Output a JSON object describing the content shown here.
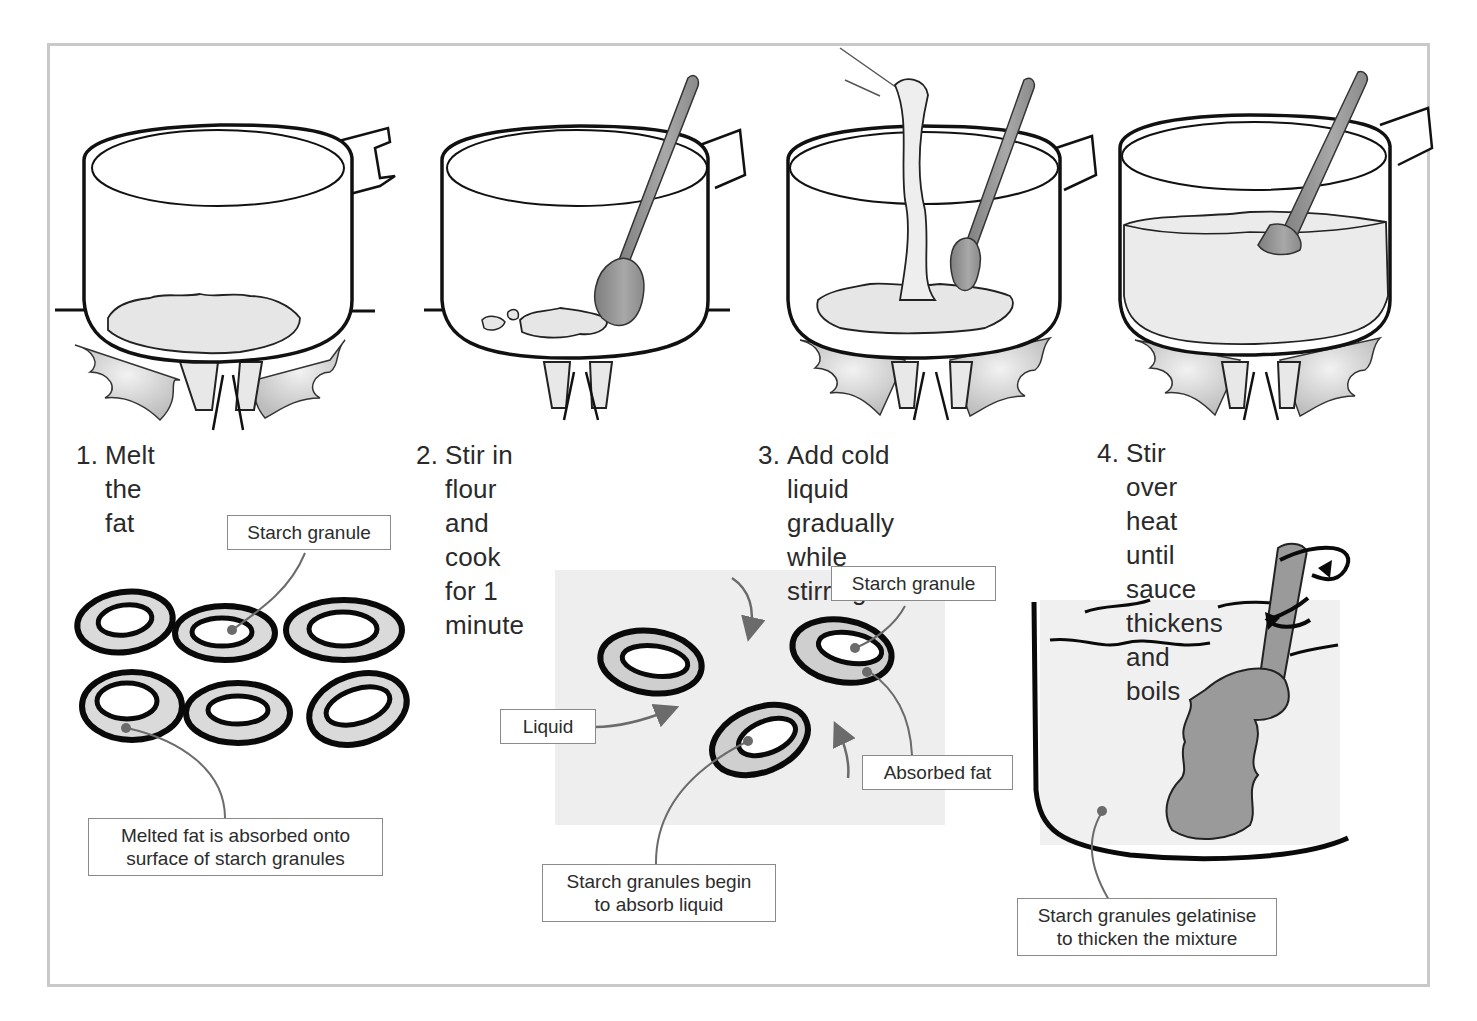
{
  "steps": [
    {
      "number": "1.",
      "text": "Melt the fat"
    },
    {
      "number": "2.",
      "text": "Stir in flour and cook\nfor 1 minute"
    },
    {
      "number": "3.",
      "text": "Add cold liquid\ngradually while\nstirring"
    },
    {
      "number": "4.",
      "text": "Stir over heat until\nsauce thickens and\nboils"
    }
  ],
  "panel1": {
    "label_top": "Starch granule",
    "label_bottom": "Melted fat is absorbed onto\nsurface of starch granules"
  },
  "panel2": {
    "label_starch": "Starch granule",
    "label_liquid": "Liquid",
    "label_fat": "Absorbed fat",
    "label_bottom": "Starch granules begin\nto absorb liquid"
  },
  "panel3": {
    "label_bottom": "Starch granules gelatinise\nto thicken the mixture"
  },
  "colors": {
    "frame": "#c9c9c9",
    "ink": "#111111",
    "fill_light": "#e6e6e6",
    "fill_mid": "#9a9a9a",
    "leader": "#6b6b6b"
  }
}
